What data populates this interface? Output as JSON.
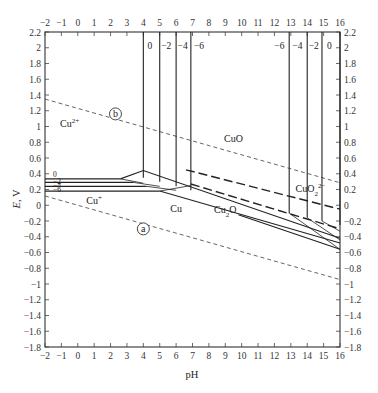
{
  "chart_data": {
    "type": "line",
    "title": "",
    "xlabel": "pH",
    "ylabel": "E, V",
    "xlim": [
      -2,
      16
    ],
    "ylim": [
      -1.8,
      2.2
    ],
    "x_ticks": [
      -2,
      -1,
      0,
      1,
      2,
      3,
      4,
      5,
      6,
      7,
      8,
      9,
      10,
      11,
      12,
      13,
      14,
      15,
      16
    ],
    "y_ticks": [
      2.2,
      2,
      1.8,
      1.6,
      1.4,
      1.2,
      1,
      0.8,
      0.6,
      0.4,
      0.2,
      0,
      -0.2,
      -0.4,
      -0.6,
      -0.8,
      -1,
      -1.2,
      -1.4,
      -1.6,
      -1.8
    ],
    "grid": false,
    "regions": [
      {
        "label": "Cu2+",
        "display": "Cu",
        "sup": "2+",
        "pH": -0.5,
        "E": 1.0
      },
      {
        "label": "Cu+",
        "display": "Cu",
        "sup": "+",
        "pH": 1.0,
        "E": 0.02
      },
      {
        "label": "CuO",
        "display": "CuO",
        "pH": 9.5,
        "E": 0.8
      },
      {
        "label": "CuO2 2-",
        "display": "CuO",
        "sub": "2",
        "sup": "2−",
        "pH": 14.2,
        "E": 0.17
      },
      {
        "label": "Cu2O",
        "display": "Cu",
        "sub": "2",
        "tail": "O",
        "pH": 9.0,
        "E": -0.1
      },
      {
        "label": "Cu",
        "display": "Cu",
        "pH": 6.0,
        "E": -0.08
      }
    ],
    "water_lines": [
      {
        "name": "b",
        "label": "b",
        "style": "dashed",
        "x": [
          -2,
          16
        ],
        "y": [
          1.348,
          0.286
        ],
        "marker_at": {
          "pH": 2.3,
          "E": 1.16
        }
      },
      {
        "name": "a",
        "label": "a",
        "style": "dashed",
        "x": [
          -2,
          16
        ],
        "y": [
          0.118,
          -0.944
        ],
        "marker_at": {
          "pH": 4.0,
          "E": -0.3
        }
      }
    ],
    "concentration_labels_left": [
      "0",
      "-2",
      "-4",
      "-6"
    ],
    "concentration_labels_top_left": [
      "0",
      "-2",
      "-4",
      "-6"
    ],
    "concentration_labels_top_right": [
      "-6",
      "-4",
      "-2",
      "0"
    ],
    "series": [
      {
        "name": "Cu2+/Cu+ log c=0",
        "style": "solid",
        "x": [
          -2,
          2.6
        ],
        "y": [
          0.335,
          0.335
        ]
      },
      {
        "name": "Cu2+/Cu+ log c=-2",
        "style": "solid",
        "x": [
          -2,
          3.4
        ],
        "y": [
          0.29,
          0.29
        ]
      },
      {
        "name": "Cu2+/Cu+ log c=-4",
        "style": "solid",
        "x": [
          -2,
          4.2
        ],
        "y": [
          0.24,
          0.24
        ]
      },
      {
        "name": "Cu2+/Cu+ log c=-6",
        "style": "solid",
        "x": [
          -2,
          5.0
        ],
        "y": [
          0.18,
          0.18
        ]
      },
      {
        "name": "CuO/Cu2+ log c=0",
        "style": "solid",
        "x": [
          4.0,
          4.0
        ],
        "y": [
          2.2,
          0.35
        ]
      },
      {
        "name": "CuO/Cu2+ log c=-2",
        "style": "solid",
        "x": [
          5.0,
          5.0
        ],
        "y": [
          2.2,
          0.3
        ]
      },
      {
        "name": "CuO/Cu2+ log c=-4",
        "style": "solid",
        "x": [
          6.0,
          6.0
        ],
        "y": [
          2.2,
          0.24
        ]
      },
      {
        "name": "CuO/Cu2+ log c=-6",
        "style": "solid",
        "x": [
          6.9,
          6.9
        ],
        "y": [
          2.2,
          0.19
        ]
      },
      {
        "name": "CuO/CuO2 2- log c=-6",
        "style": "solid",
        "x": [
          12.9,
          12.9
        ],
        "y": [
          2.2,
          -0.1
        ]
      },
      {
        "name": "CuO/CuO2 2- log c=-4",
        "style": "solid",
        "x": [
          14.0,
          14.0
        ],
        "y": [
          2.2,
          -0.16
        ]
      },
      {
        "name": "CuO/CuO2 2- log c=-2",
        "style": "solid",
        "x": [
          14.9,
          14.9
        ],
        "y": [
          2.2,
          -0.2
        ]
      },
      {
        "name": "CuO/CuO2 2- log c=0",
        "style": "solid",
        "x": [
          16,
          16
        ],
        "y": [
          2.2,
          -0.25
        ]
      },
      {
        "name": "Cu+ / CuO upper bound",
        "style": "solid",
        "x": [
          2.6,
          4.0,
          16
        ],
        "y": [
          0.335,
          0.44,
          -0.42
        ]
      },
      {
        "name": "Cu2O/Cu",
        "style": "solid",
        "x": [
          5.0,
          16
        ],
        "y": [
          0.18,
          -0.48
        ]
      },
      {
        "name": "Cu2O/Cu lower",
        "style": "solid",
        "x": [
          9.8,
          16
        ],
        "y": [
          -0.12,
          -0.56
        ]
      },
      {
        "name": "CuO/Cu2O dashed",
        "style": "dashed-long",
        "x": [
          6.6,
          16
        ],
        "y": [
          0.45,
          -0.05
        ]
      },
      {
        "name": "Cu2O boundary dashed",
        "style": "dashed-long",
        "x": [
          6.9,
          16
        ],
        "y": [
          0.27,
          -0.3
        ]
      }
    ]
  },
  "axes": {
    "x_title": "pH",
    "y_title_italic": "E",
    "y_title_unit": ", V"
  }
}
